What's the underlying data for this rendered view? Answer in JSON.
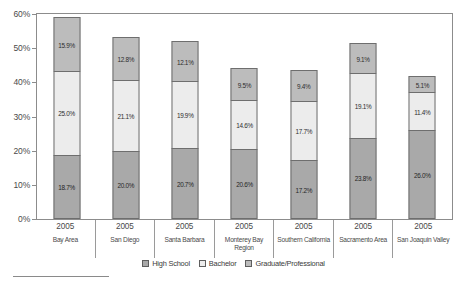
{
  "chart_data": {
    "type": "bar",
    "subtype": "stacked-bar",
    "title": "",
    "xlabel": "",
    "ylabel": "",
    "ylim": [
      0,
      60
    ],
    "yunit": "%",
    "ytick_labels": [
      "60%",
      "50%",
      "40%",
      "30%",
      "20%",
      "10%",
      "0%"
    ],
    "ytick_values": [
      60,
      50,
      40,
      30,
      20,
      10,
      0
    ],
    "grid": false,
    "legend_position": "bottom",
    "categories": [
      "Bay Area",
      "San Diego",
      "Santa Barbara",
      "Monterey Bay Region",
      "Southern California",
      "Sacramento Area",
      "San Joaquin Valley"
    ],
    "category_years": [
      "2005",
      "2005",
      "2005",
      "2005",
      "2005",
      "2005",
      "2005"
    ],
    "series": [
      {
        "name": "High School",
        "values": [
          18.7,
          20.0,
          20.7,
          20.6,
          17.2,
          23.8,
          26.0
        ],
        "labels": [
          "18.7%",
          "20.0%",
          "20.7%",
          "20.6%",
          "17.2%",
          "23.8%",
          "26.0%"
        ],
        "color": "#a9a9a9"
      },
      {
        "name": "Bachelor",
        "values": [
          25.0,
          21.1,
          19.9,
          14.6,
          17.7,
          19.1,
          11.4
        ],
        "labels": [
          "25.0%",
          "21.1%",
          "19.9%",
          "14.6%",
          "17.7%",
          "19.1%",
          "11.4%"
        ],
        "color": "#ececec"
      },
      {
        "name": "Graduate/Professional",
        "values": [
          15.9,
          12.8,
          12.1,
          9.5,
          9.4,
          9.1,
          5.1
        ],
        "labels": [
          "15.9%",
          "12.8%",
          "12.1%",
          "9.5%",
          "9.4%",
          "9.1%",
          "5.1%"
        ],
        "color": "#bcbcbc"
      }
    ],
    "totals": [
      59.6,
      53.9,
      52.7,
      44.7,
      44.3,
      52.0,
      42.5
    ]
  },
  "legend": {
    "items": [
      {
        "label": "High School"
      },
      {
        "label": "Bachelor"
      },
      {
        "label": "Graduate/Professional"
      }
    ]
  }
}
